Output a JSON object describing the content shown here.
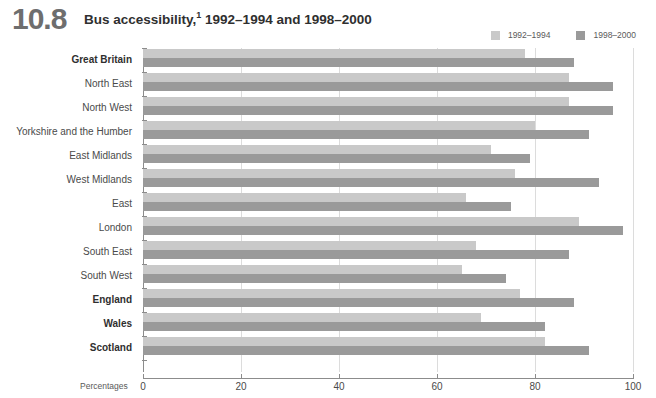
{
  "header": {
    "number": "10.8",
    "title": "Bus accessibility,",
    "footnote_marker": "1",
    "title_rest": " 1992–1994 and 1998–2000"
  },
  "legend": {
    "items": [
      {
        "label": "1992–1994",
        "color": "#c9c9c9",
        "swatch": "legend-swatch-1992-1994"
      },
      {
        "label": "1998–2000",
        "color": "#9a9a9a",
        "swatch": "legend-swatch-1998-2000"
      }
    ]
  },
  "axis": {
    "units_label": "Percentages",
    "ticks": [
      "0",
      "20",
      "40",
      "60",
      "80",
      "100"
    ],
    "xmin": 0,
    "xmax": 100
  },
  "chart_data": {
    "type": "bar",
    "orientation": "horizontal",
    "title": "Bus accessibility,1 1992–1994 and 1998–2000",
    "xlabel": "Percentages",
    "ylabel": "",
    "xlim": [
      0,
      100
    ],
    "grid": true,
    "legend_position": "top-right",
    "categories": [
      "Great Britain",
      "North East",
      "North West",
      "Yorkshire and the Humber",
      "East Midlands",
      "West Midlands",
      "East",
      "London",
      "South East",
      "South West",
      "England",
      "Wales",
      "Scotland"
    ],
    "emphasised_categories": [
      "Great Britain",
      "England",
      "Wales",
      "Scotland"
    ],
    "series": [
      {
        "name": "1992–1994",
        "color": "#c9c9c9",
        "values": [
          78,
          87,
          87,
          80,
          71,
          76,
          66,
          89,
          68,
          65,
          77,
          69,
          82
        ]
      },
      {
        "name": "1998–2000",
        "color": "#9a9a9a",
        "values": [
          88,
          96,
          96,
          91,
          79,
          93,
          75,
          98,
          87,
          74,
          88,
          82,
          91
        ]
      }
    ]
  }
}
